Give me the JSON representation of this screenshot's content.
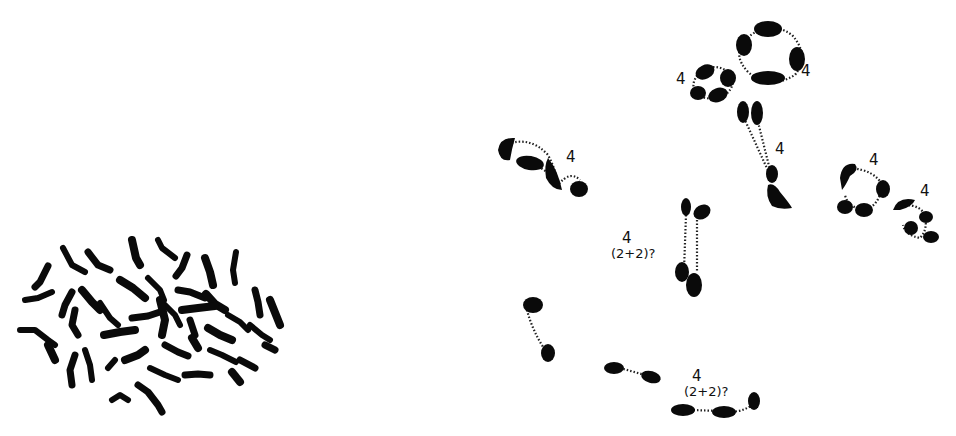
{
  "figure": {
    "left_panel": {
      "description": "mitotic metaphase spread",
      "chromosome_count_drawn": 44
    },
    "right_panel": {
      "description": "meiotic configurations",
      "labels": [
        {
          "id": "ring-small",
          "text": "4"
        },
        {
          "id": "ring-large",
          "text": "4"
        },
        {
          "id": "chain-left",
          "text": "4"
        },
        {
          "id": "cross-center",
          "text": "4"
        },
        {
          "id": "ring-right-a",
          "text": "4"
        },
        {
          "id": "ring-right-b",
          "text": "4"
        },
        {
          "id": "pair-mid",
          "text": "4",
          "subtext": "(2+2)?"
        },
        {
          "id": "chain-bottom",
          "text": "4",
          "subtext": "(2+2)?"
        }
      ]
    }
  }
}
